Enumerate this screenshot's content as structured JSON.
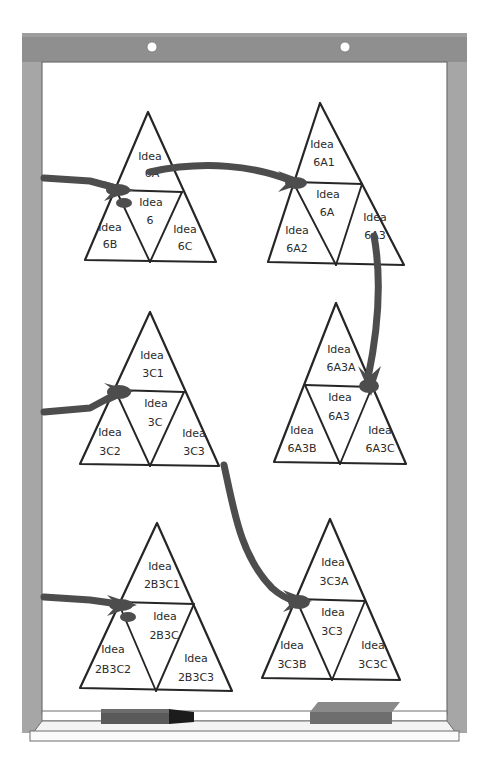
{
  "scene": {
    "kind": "whiteboard-diagram",
    "surface_color": "#ffffff",
    "frame_color": "#a9a9a9",
    "frame_top_color": "#8f8f8f",
    "ink_color": "#262626",
    "arrow_color": "#4d4d4d"
  },
  "board": {
    "mount_screw_left": "screw",
    "mount_screw_right": "screw"
  },
  "tray": {
    "marker": {
      "name": "whiteboard-marker",
      "body_color": "#5a5a5a",
      "tip_color": "#1c1c1c"
    },
    "eraser": {
      "name": "whiteboard-eraser",
      "top_color": "#8a8a8a",
      "front_color": "#6e6e6e"
    }
  },
  "triangles": [
    {
      "id": "tri-6",
      "top": "Idea\n6A",
      "top_line1": "Idea",
      "top_line2": "6A",
      "center_line1": "Idea",
      "center_line2": "6",
      "left_line1": "Idea",
      "left_line2": "6B",
      "right_line1": "Idea",
      "right_line2": "6C"
    },
    {
      "id": "tri-6A",
      "top_line1": "Idea",
      "top_line2": "6A1",
      "center_line1": "Idea",
      "center_line2": "6A",
      "left_line1": "Idea",
      "left_line2": "6A2",
      "right_line1": "Idea",
      "right_line2": "6A3"
    },
    {
      "id": "tri-3C",
      "top_line1": "Idea",
      "top_line2": "3C1",
      "center_line1": "Idea",
      "center_line2": "3C",
      "left_line1": "Idea",
      "left_line2": "3C2",
      "right_line1": "Idea",
      "right_line2": "3C3"
    },
    {
      "id": "tri-6A3",
      "top_line1": "Idea",
      "top_line2": "6A3A",
      "center_line1": "Idea",
      "center_line2": "6A3",
      "left_line1": "Idea",
      "left_line2": "6A3B",
      "right_line1": "Idea",
      "right_line2": "6A3C"
    },
    {
      "id": "tri-2B3C",
      "top_line1": "Idea",
      "top_line2": "2B3C1",
      "center_line1": "Idea",
      "center_line2": "2B3C",
      "left_line1": "Idea",
      "left_line2": "2B3C2",
      "right_line1": "Idea",
      "right_line2": "2B3C3"
    },
    {
      "id": "tri-3C3",
      "top_line1": "Idea",
      "top_line2": "3C3A",
      "center_line1": "Idea",
      "center_line2": "3C3",
      "left_line1": "Idea",
      "left_line2": "3C3B",
      "right_line1": "Idea",
      "right_line2": "3C3C"
    }
  ],
  "connections": [
    {
      "from": "offscreen-left",
      "to": "tri-6"
    },
    {
      "from": "tri-6",
      "to": "tri-6A"
    },
    {
      "from": "tri-6A",
      "to": "tri-6A3"
    },
    {
      "from": "offscreen-left",
      "to": "tri-3C"
    },
    {
      "from": "tri-3C",
      "to": "tri-3C3"
    },
    {
      "from": "offscreen-left",
      "to": "tri-2B3C"
    }
  ]
}
